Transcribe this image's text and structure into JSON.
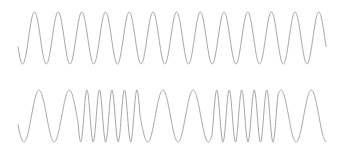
{
  "panel": {
    "name": "waveform-panel",
    "width": 338,
    "height": 159,
    "background_color": "#ffffff"
  },
  "chart_data": {
    "type": "line",
    "title": "",
    "subtitle": "",
    "xlabel": "",
    "ylabel": "",
    "grid": false,
    "legend": "none",
    "axes_visible": false,
    "tick_labels": [],
    "annotations": [],
    "stroke_color": "#a6a6a6",
    "stroke_width": 1,
    "xlim": [
      0,
      338
    ],
    "ylim": [
      0,
      159
    ],
    "series": [
      {
        "name": "top-waveform",
        "label": "Carrier waveform (constant frequency)",
        "color": "#a6a6a6",
        "baseline_y": 38,
        "amplitude": 26,
        "x_start": 18,
        "x_end": 326,
        "start_phase_deg": 200,
        "cycles": 13,
        "frequency_profile": "constant",
        "frequency_segments": [
          {
            "x_from": 18,
            "x_to": 326,
            "cycles_per_100px": 4.22
          }
        ]
      },
      {
        "name": "bottom-waveform",
        "label": "Frequency-modulated waveform",
        "color": "#a6a6a6",
        "baseline_y": 116,
        "amplitude": 26,
        "x_start": 18,
        "x_end": 326,
        "start_phase_deg": 200,
        "cycles": 12,
        "frequency_profile": "modulated",
        "frequency_segments": [
          {
            "x_from": 18,
            "x_to": 78,
            "cycles_per_100px": 3.3,
            "speed": "slow"
          },
          {
            "x_from": 78,
            "x_to": 140,
            "cycles_per_100px": 8.0,
            "speed": "fast"
          },
          {
            "x_from": 140,
            "x_to": 212,
            "cycles_per_100px": 3.3,
            "speed": "slow"
          },
          {
            "x_from": 212,
            "x_to": 278,
            "cycles_per_100px": 8.0,
            "speed": "fast"
          },
          {
            "x_from": 278,
            "x_to": 326,
            "cycles_per_100px": 3.3,
            "speed": "slow"
          }
        ]
      }
    ]
  }
}
